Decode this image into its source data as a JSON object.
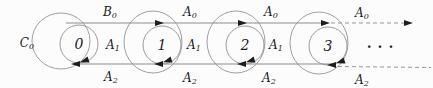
{
  "figure": {
    "type": "state-transition-diagram",
    "states": [
      {
        "label": "0"
      },
      {
        "label": "1"
      },
      {
        "label": "2"
      },
      {
        "label": "3"
      }
    ],
    "ellipsis": "...",
    "self_loop_label_state0": {
      "base": "C",
      "sub": "0"
    },
    "top_transition_labels": [
      {
        "base": "B",
        "sub": "0"
      },
      {
        "base": "A",
        "sub": "0"
      },
      {
        "base": "A",
        "sub": "0"
      },
      {
        "base": "A",
        "sub": "0"
      }
    ],
    "middle_labels": [
      {
        "base": "A",
        "sub": "1"
      },
      {
        "base": "A",
        "sub": "1"
      },
      {
        "base": "A",
        "sub": "1"
      }
    ],
    "bottom_transition_labels": [
      {
        "base": "A",
        "sub": "2"
      },
      {
        "base": "A",
        "sub": "2"
      },
      {
        "base": "A",
        "sub": "2"
      },
      {
        "base": "A",
        "sub": "2"
      }
    ],
    "colors": {
      "background": "#fcfcfc",
      "circle_stroke": "#a0a0a0",
      "line_stroke": "#8c8c8c",
      "ink": "#1d1d1d"
    }
  }
}
